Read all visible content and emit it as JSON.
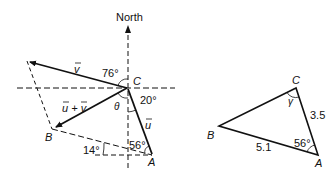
{
  "left_diagram": {
    "north_label": "North",
    "point_C": "C",
    "point_B": "B",
    "point_A": "A",
    "vector_v": "v",
    "vector_u": "u",
    "vector_sum": "u + v",
    "angle_76": "76°",
    "angle_20": "20°",
    "angle_56": "56°",
    "angle_14": "14°",
    "angle_theta": "θ"
  },
  "right_triangle": {
    "point_C": "C",
    "point_B": "B",
    "point_A": "A",
    "angle_gamma": "γ",
    "side_CA": "3.5",
    "side_BA": "5.1",
    "angle_A": "56°"
  }
}
